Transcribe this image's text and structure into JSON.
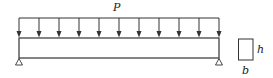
{
  "diagram": {
    "type": "simply-supported-beam-uniform-load",
    "load_label": "P",
    "section_height_label": "h",
    "section_width_label": "b",
    "arrow_count": 11,
    "colors": {
      "line": "#333333",
      "background": "#ffffff"
    }
  }
}
